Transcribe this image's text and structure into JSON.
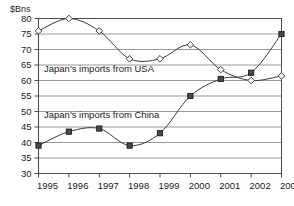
{
  "chart_data": {
    "type": "line",
    "title": "",
    "subtitle": "",
    "xlabel": "",
    "ylabel": "$Bns",
    "y_axis_title": "$Bns",
    "categories": [
      "1995",
      "1996",
      "1997",
      "1998",
      "1999",
      "2000",
      "2001",
      "2002",
      "2003"
    ],
    "x": [
      1995,
      1996,
      1997,
      1998,
      1999,
      2000,
      2001,
      2002,
      2003
    ],
    "xlim": [
      1995,
      2003
    ],
    "ylim": [
      30,
      80
    ],
    "y_ticks": [
      30,
      35,
      40,
      45,
      50,
      55,
      60,
      65,
      70,
      75,
      80
    ],
    "grid": "horizontal",
    "legend_position": "inline-annotations",
    "series": [
      {
        "name": "Japan's imports from USA",
        "marker": "open-diamond",
        "values": [
          76,
          80,
          76,
          67,
          67,
          71.5,
          63.5,
          60,
          61.5
        ]
      },
      {
        "name": "Japan's imports from China",
        "marker": "filled-square",
        "values": [
          39,
          43.5,
          44.5,
          39,
          43,
          55,
          60.5,
          62.5,
          75
        ]
      }
    ],
    "annotations": [
      {
        "text": "Japan's imports from USA",
        "value_near": 64
      },
      {
        "text": "Japan's imports from China",
        "value_near": 49
      }
    ]
  },
  "colors": {
    "background": "#ffffff",
    "grid": "#8c8c8c",
    "axis": "#4d4d4d",
    "line": "#3a3a3a",
    "marker_fill": "#4a4a4a",
    "text": "#1a1a1a"
  }
}
